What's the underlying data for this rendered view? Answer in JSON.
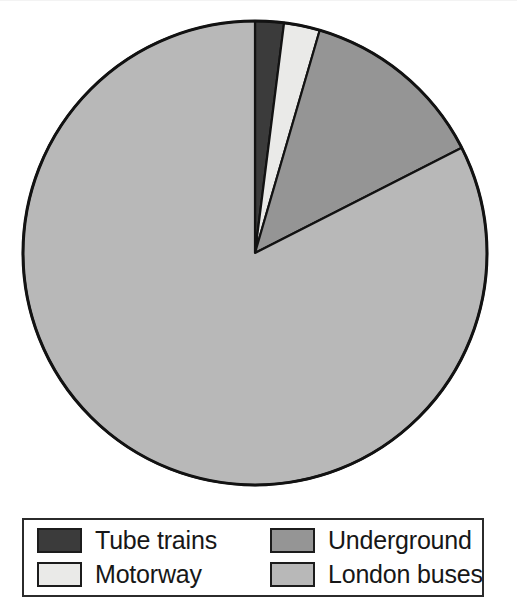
{
  "chart_data": {
    "type": "pie",
    "title": "",
    "categories": [
      "Tube trains",
      "Motorway",
      "Underground",
      "London buses"
    ],
    "values": [
      2,
      2.5,
      13,
      82.5
    ],
    "unit": "percent",
    "start_angle_deg": 0,
    "direction": "clockwise",
    "colors": [
      "#3b3b3b",
      "#eaeae8",
      "#959595",
      "#b8b8b8"
    ],
    "slice_angles_deg": [
      7.2,
      9.0,
      46.8,
      297.0
    ],
    "legend": {
      "position": "bottom",
      "columns": 2,
      "border_color": "#2b2b2b",
      "background": "#ffffff",
      "entries": [
        {
          "label": "Tube trains",
          "color": "#3b3b3b"
        },
        {
          "label": "Motorway",
          "color": "#eaeae8"
        },
        {
          "label": "Underground",
          "color": "#959595"
        },
        {
          "label": "London buses",
          "color": "#b8b8b8"
        }
      ]
    },
    "axis": {
      "grid": false,
      "xlabel": "",
      "ylabel": ""
    },
    "geometry": {
      "center_x": 255,
      "center_y": 253,
      "radius": 232,
      "outline_color": "#121212",
      "outline_width": 3
    }
  }
}
